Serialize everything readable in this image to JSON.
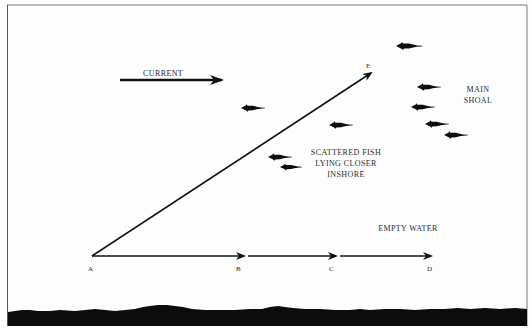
{
  "diagram": {
    "title": "",
    "labels": {
      "current": "CURRENT",
      "main_shoal_line1": "MAIN",
      "main_shoal_line2": "SHOAL",
      "scattered_line1": "SCATTERED FISH",
      "scattered_line2": "LYING CLOSER",
      "scattered_line3": "INSHORE",
      "empty_water": "EMPTY WATER"
    },
    "points": {
      "A": "A",
      "B": "B",
      "C": "C",
      "D": "D",
      "E": "E"
    },
    "arrows": [
      {
        "id": "current",
        "from": [
          120,
          80
        ],
        "to": [
          222,
          80
        ]
      },
      {
        "id": "A-E",
        "from": [
          92,
          256
        ],
        "to": [
          371,
          73
        ]
      },
      {
        "id": "A-B",
        "from": [
          92,
          256
        ],
        "to": [
          244,
          256
        ]
      },
      {
        "id": "B-C",
        "from": [
          248,
          256
        ],
        "to": [
          336,
          256
        ]
      },
      {
        "id": "C-D",
        "from": [
          340,
          256
        ],
        "to": [
          430,
          256
        ]
      }
    ],
    "fish": [
      {
        "group": "scattered",
        "x": 253,
        "y": 108
      },
      {
        "group": "main-shoal",
        "x": 399,
        "y": 46
      },
      {
        "group": "main-shoal",
        "x": 419,
        "y": 87
      },
      {
        "group": "main-shoal",
        "x": 413,
        "y": 107
      },
      {
        "group": "main-shoal",
        "x": 427,
        "y": 124
      },
      {
        "group": "main-shoal",
        "x": 446,
        "y": 135
      },
      {
        "group": "scattered",
        "x": 331,
        "y": 125
      },
      {
        "group": "scattered",
        "x": 270,
        "y": 157
      },
      {
        "group": "scattered",
        "x": 282,
        "y": 167
      }
    ],
    "colors": {
      "ink": "#111111",
      "background": "#fdfdfd",
      "seabed": "#0c0c0c"
    }
  }
}
